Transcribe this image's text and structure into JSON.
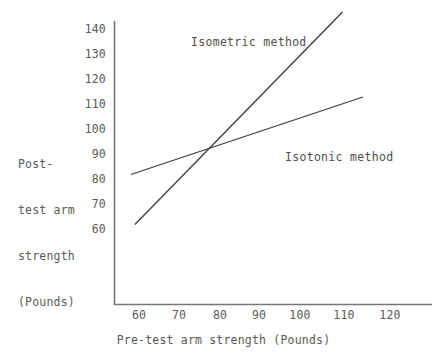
{
  "chart_data": {
    "type": "line",
    "title": "",
    "xlabel": "Pre-test arm strength (Pounds)",
    "ylabel": "Post-\ntest arm\nstrength\n(Pounds)",
    "ylabel_lines": [
      "Post-",
      "test arm",
      "strength",
      "(Pounds)"
    ],
    "xlim": [
      55,
      125
    ],
    "ylim": [
      55,
      147
    ],
    "xticks": [
      60,
      70,
      80,
      90,
      100,
      110,
      120
    ],
    "yticks": [
      60,
      70,
      80,
      90,
      100,
      110,
      120,
      130,
      140
    ],
    "xtick_labels": [
      "60",
      "70",
      "80",
      "90",
      "100",
      "110",
      "120"
    ],
    "ytick_labels": [
      "60",
      "70",
      "80",
      "90",
      "100",
      "110",
      "120",
      "130",
      "140"
    ],
    "grid": false,
    "legend_position": "inline-annotations",
    "line_color": "#3a3a3a",
    "axis_color": "#777777",
    "series": [
      {
        "name": "Isometric method",
        "label": "Isometric method",
        "label_x": 86,
        "label_y": 141,
        "x": [
          59,
          110
        ],
        "y": [
          61,
          146
        ],
        "slope": 1.667,
        "values": [
          61,
          146
        ]
      },
      {
        "name": "Isotonic method",
        "label": "Isotonic method",
        "label_x": 98,
        "label_y": 96,
        "x": [
          58,
          115
        ],
        "y": [
          81,
          112
        ],
        "slope": 0.544,
        "values": [
          81,
          112
        ]
      }
    ],
    "annotations": [
      {
        "text": "Isometric method",
        "x": 86,
        "y": 141
      },
      {
        "text": "Isotonic method",
        "x": 98,
        "y": 96
      }
    ],
    "intersection": {
      "x": 78,
      "y": 91
    }
  }
}
